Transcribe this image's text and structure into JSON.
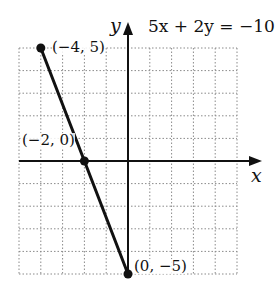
{
  "chart_data": {
    "type": "line",
    "title": "5x + 2y = −10",
    "xlabel": "x",
    "ylabel": "y",
    "xlim": [
      -5,
      5
    ],
    "ylim": [
      -5,
      5
    ],
    "grid": true,
    "grid_style": "dotted",
    "legend": null,
    "series": [
      {
        "name": "5x + 2y = −10",
        "x": [
          -4,
          0
        ],
        "y": [
          5,
          -5
        ],
        "color": "#111111"
      }
    ],
    "points": [
      {
        "x": -4,
        "y": 5,
        "label": "(−4, 5)"
      },
      {
        "x": -2,
        "y": 0,
        "label": "(−2, 0)"
      },
      {
        "x": 0,
        "y": -5,
        "label": "(0, −5)"
      }
    ]
  },
  "labels": {
    "equation": "5x + 2y = −10",
    "x_axis": "x",
    "y_axis": "y",
    "point_a": "(−4, 5)",
    "point_b": "(−2, 0)",
    "point_c": "(0, −5)"
  }
}
